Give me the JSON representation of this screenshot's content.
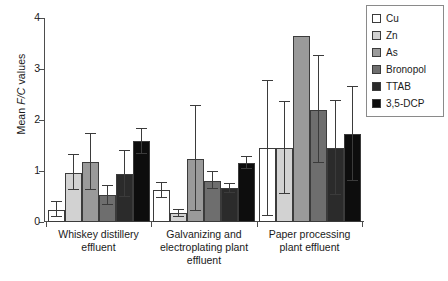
{
  "chart_data": {
    "type": "bar",
    "title": "",
    "xlabel": "",
    "ylabel": "Mean F/C values",
    "ylabel_plain": "Mean ",
    "ylabel_italic": "F/C",
    "ylabel_tail": " values",
    "ylim": [
      0,
      4
    ],
    "yticks": [
      0,
      1,
      2,
      3,
      4
    ],
    "ytick_labels": [
      "0",
      "1",
      "2",
      "3",
      "4"
    ],
    "grid": false,
    "legend_position": "top-right",
    "categories": [
      "Whiskey distillery effluent",
      "Galvanizing and electroplating plant effluent",
      "Paper processing plant effluent"
    ],
    "category_lines": [
      [
        "Whiskey distillery",
        "effluent"
      ],
      [
        "Galvanizing and",
        "electroplating plant",
        "effluent"
      ],
      [
        "Paper processing",
        "plant effluent"
      ]
    ],
    "series": [
      {
        "name": "Cu",
        "color": "#ffffff",
        "values": [
          0.24,
          0.62,
          1.45
        ],
        "err_low": [
          0.14,
          0.14,
          1.33
        ],
        "err_high": [
          0.15,
          0.15,
          1.32
        ]
      },
      {
        "name": "Zn",
        "color": "#d2d2d2",
        "values": [
          0.97,
          0.17,
          1.45
        ],
        "err_low": [
          0.35,
          0.07,
          0.9
        ],
        "err_high": [
          0.35,
          0.07,
          0.9
        ]
      },
      {
        "name": "As",
        "color": "#9a9a9a",
        "values": [
          1.17,
          1.24,
          3.65
        ],
        "err_low": [
          0.55,
          1.03,
          0.0
        ],
        "err_high": [
          0.55,
          1.03,
          0.0
        ]
      },
      {
        "name": "Bronopol",
        "color": "#6e6e6e",
        "values": [
          0.52,
          0.81,
          2.2
        ],
        "err_low": [
          0.18,
          0.17,
          1.05
        ],
        "err_high": [
          0.18,
          0.17,
          1.05
        ]
      },
      {
        "name": "TTAB",
        "color": "#2b2b2b",
        "values": [
          0.95,
          0.66,
          1.45
        ],
        "err_low": [
          0.45,
          0.09,
          0.92
        ],
        "err_high": [
          0.45,
          0.09,
          0.92
        ]
      },
      {
        "name": "3,5-DCP",
        "color": "#0d0d0d",
        "values": [
          1.58,
          1.15,
          1.73
        ],
        "err_low": [
          0.25,
          0.12,
          0.92
        ],
        "err_high": [
          0.25,
          0.12,
          0.92
        ]
      }
    ]
  },
  "legend": {
    "items": [
      {
        "label": "Cu",
        "color": "#ffffff"
      },
      {
        "label": "Zn",
        "color": "#d2d2d2"
      },
      {
        "label": "As",
        "color": "#9a9a9a"
      },
      {
        "label": "Bronopol",
        "color": "#6e6e6e"
      },
      {
        "label": "TTAB",
        "color": "#2b2b2b"
      },
      {
        "label": "3,5-DCP",
        "color": "#0d0d0d"
      }
    ]
  }
}
